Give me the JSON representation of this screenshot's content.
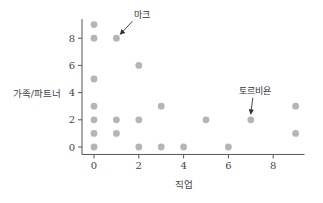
{
  "chart_data": {
    "type": "scatter",
    "title": "",
    "xlabel": "직업",
    "ylabel": "가족/파트너",
    "xlim": [
      -0.4,
      9.4
    ],
    "ylim": [
      -0.4,
      9.4
    ],
    "xticks": [
      0,
      2,
      4,
      6,
      8
    ],
    "yticks": [
      0,
      2,
      4,
      6,
      8
    ],
    "grid": false,
    "legend": null,
    "point_color": "#b5b5b5",
    "points": [
      {
        "x": 0,
        "y": 9
      },
      {
        "x": 0,
        "y": 8
      },
      {
        "x": 0,
        "y": 5
      },
      {
        "x": 0,
        "y": 3
      },
      {
        "x": 0,
        "y": 2
      },
      {
        "x": 0,
        "y": 1
      },
      {
        "x": 0,
        "y": 0
      },
      {
        "x": 1,
        "y": 8
      },
      {
        "x": 1,
        "y": 2
      },
      {
        "x": 1,
        "y": 1
      },
      {
        "x": 2,
        "y": 6
      },
      {
        "x": 2,
        "y": 2
      },
      {
        "x": 2,
        "y": 0
      },
      {
        "x": 3,
        "y": 3
      },
      {
        "x": 3,
        "y": 0
      },
      {
        "x": 4,
        "y": 0
      },
      {
        "x": 5,
        "y": 2
      },
      {
        "x": 6,
        "y": 0
      },
      {
        "x": 7,
        "y": 2
      },
      {
        "x": 9,
        "y": 3
      },
      {
        "x": 9,
        "y": 1
      }
    ],
    "annotations": [
      {
        "text": "마크",
        "point": {
          "x": 1,
          "y": 8
        }
      },
      {
        "text": "토르비욘",
        "point": {
          "x": 7,
          "y": 2
        }
      }
    ]
  }
}
